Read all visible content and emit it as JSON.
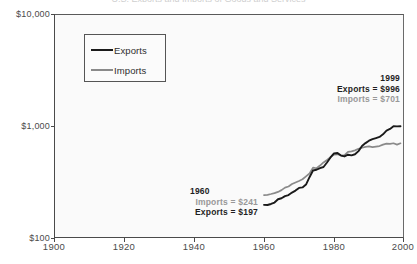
{
  "chart_data": {
    "type": "line",
    "title": "U.S. Exports and Imports of Goods and Services",
    "xlabel": "",
    "ylabel": "",
    "yscale": "log",
    "ylim": [
      100,
      10000
    ],
    "xlim": [
      1900,
      2000
    ],
    "grid": false,
    "legend_position": "upper-left",
    "y_tick_labels": [
      "$10,000",
      "$1,000",
      "$100"
    ],
    "y_tick_values": [
      10000,
      1000,
      100
    ],
    "x_tick_labels": [
      "1900",
      "1920",
      "1940",
      "1960",
      "1980",
      "2000"
    ],
    "x_tick_values": [
      1900,
      1920,
      1940,
      1960,
      1980,
      2000
    ],
    "series": [
      {
        "name": "Exports",
        "color": "#1a1a1a",
        "x": [
          1960,
          1961,
          1962,
          1963,
          1964,
          1965,
          1966,
          1967,
          1968,
          1969,
          1970,
          1971,
          1972,
          1973,
          1974,
          1975,
          1976,
          1977,
          1978,
          1979,
          1980,
          1981,
          1982,
          1983,
          1984,
          1985,
          1986,
          1987,
          1988,
          1989,
          1990,
          1991,
          1992,
          1993,
          1994,
          1995,
          1996,
          1997,
          1998,
          1999
        ],
        "values": [
          197,
          196,
          203,
          213,
          238,
          246,
          264,
          274,
          298,
          318,
          348,
          354,
          390,
          499,
          625,
          641,
          679,
          703,
          818,
          969,
          1110,
          1125,
          1031,
          1003,
          1063,
          1040,
          1080,
          1200,
          1420,
          1570,
          1700,
          1790,
          1860,
          1930,
          2110,
          2390,
          2530,
          2770,
          2750,
          996
        ]
      },
      {
        "name": "Imports",
        "color": "#8a8a8a",
        "x": [
          1960,
          1961,
          1962,
          1963,
          1964,
          1965,
          1966,
          1967,
          1968,
          1969,
          1970,
          1971,
          1972,
          1973,
          1974,
          1975,
          1976,
          1977,
          1978,
          1979,
          1980,
          1981,
          1982,
          1983,
          1984,
          1985,
          1986,
          1987,
          1988,
          1989,
          1990,
          1991,
          1992,
          1993,
          1994,
          1995,
          1996,
          1997,
          1998,
          1999
        ],
        "values": [
          241,
          246,
          256,
          268,
          286,
          313,
          356,
          378,
          428,
          464,
          502,
          548,
          637,
          737,
          999,
          966,
          1110,
          1300,
          1480,
          1710,
          1950,
          1980,
          1860,
          1900,
          2240,
          2300,
          2420,
          2640,
          2780,
          2910,
          2970,
          2860,
          2940,
          3020,
          3260,
          3420,
          3400,
          3490,
          3260,
          701
        ]
      }
    ],
    "annotations": [
      {
        "id": "annot-1960",
        "year": "1960",
        "lines": [
          {
            "label": "Imports",
            "equals": "=",
            "value": "$241",
            "style": "gray"
          },
          {
            "label": "Exports",
            "equals": "=",
            "value": "$197",
            "style": "dark"
          }
        ]
      },
      {
        "id": "annot-1999",
        "year": "1999",
        "lines": [
          {
            "label": "Exports",
            "equals": "=",
            "value": "$996",
            "style": "dark"
          },
          {
            "label": "Imports",
            "equals": "=",
            "value": "$701",
            "style": "gray"
          }
        ]
      }
    ]
  },
  "legend": {
    "items": [
      {
        "label": "Exports",
        "color": "#1a1a1a"
      },
      {
        "label": "Imports",
        "color": "#8a8a8a"
      }
    ]
  },
  "colors": {
    "exports": "#1a1a1a",
    "imports": "#8a8a8a",
    "axis": "#4a4a4a",
    "plot_background": "#fafafa",
    "page_background": "#ffffff"
  }
}
